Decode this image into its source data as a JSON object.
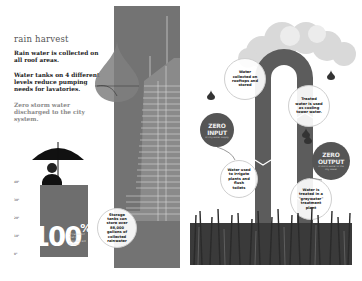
{
  "header": {
    "title": "rain harvest",
    "paragraphs": [
      "Rain water is collected on all roof areas.",
      "Water tanks on 4 different levels reduce pumping needs for lavatories.",
      "Zero storm water discharged to the city system."
    ]
  },
  "cycle": {
    "steps": [
      "Water collected on rooftops and stored",
      "Treated water is used as cooling tower water.",
      "Water used to irrigate plants and flush toilets",
      "Water is treated in a \"greywater\" treatment plant"
    ],
    "badges": [
      {
        "title": "ZERO INPUT",
        "subtitle": "of city water supply"
      },
      {
        "title": "ZERO OUTPUT",
        "subtitle": "of storm water to the city sewer"
      }
    ]
  },
  "storage": {
    "text": "Storage tanks can store over 88,000 gallons of collected rainwater"
  },
  "rainfall": {
    "big_number": "100",
    "unit": "%",
    "caption": "of rainwater that is collected will be used",
    "scale_ticks": [
      "40\"",
      "30\"",
      "20\"",
      "10\"",
      "0\""
    ]
  },
  "colors": {
    "panel": "#737373",
    "dark_badge": "#555555",
    "text": "#222222",
    "muted": "#8a8a8a"
  }
}
